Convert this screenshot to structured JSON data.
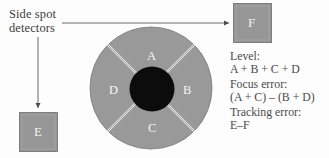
{
  "figure": {
    "kind": "optical-pickup-detector-diagram",
    "background_color": "#fdfdfd",
    "gray_fill": "#999999",
    "dark_fill": "#0a0a0a",
    "line_color": "#6b6b6b",
    "label_color": "#f2f2f2"
  },
  "annotations": {
    "side_spot_detectors": "Side spot\ndetectors"
  },
  "side_detectors": [
    {
      "name": "side-detector-f",
      "label": "F",
      "x": 233,
      "y": 3,
      "w": 39,
      "h": 40
    },
    {
      "name": "side-detector-e",
      "label": "E",
      "x": 19,
      "y": 112,
      "w": 39,
      "h": 40
    }
  ],
  "main_detector": {
    "center_x": 151,
    "center_y": 88,
    "radius": 61,
    "hub_radius": 22,
    "quadrants": [
      {
        "id": "A",
        "label": "A",
        "position": "top"
      },
      {
        "id": "B",
        "label": "B",
        "position": "right"
      },
      {
        "id": "C",
        "label": "C",
        "position": "bottom"
      },
      {
        "id": "D",
        "label": "D",
        "position": "left"
      }
    ]
  },
  "arrows": [
    {
      "name": "arrow-to-f",
      "orientation": "horizontal",
      "from_x": 62,
      "to_x": 231,
      "y": 23
    },
    {
      "name": "arrow-to-e",
      "orientation": "vertical",
      "x": 38,
      "from_y": 36,
      "to_y": 110
    }
  ],
  "formulas": [
    {
      "name": "level",
      "label": "Level:",
      "expression": "A + B + C + D"
    },
    {
      "name": "focus-error",
      "label": "Focus error:",
      "expression": "(A + C) – (B + D)"
    },
    {
      "name": "tracking-error",
      "label": "Tracking error:",
      "expression": "E–F"
    }
  ]
}
